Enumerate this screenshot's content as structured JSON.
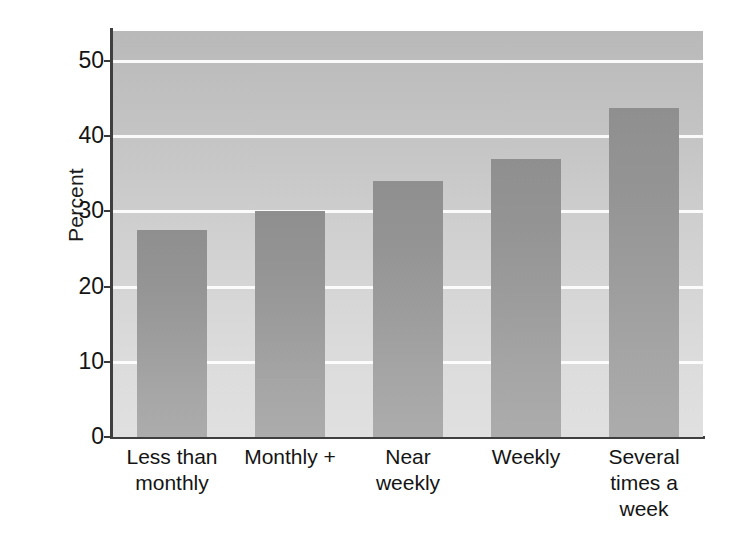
{
  "chart_data": {
    "type": "bar",
    "title": "",
    "subtitle": "",
    "xlabel": "",
    "ylabel": "Percent",
    "categories": [
      "Less than\nmonthly",
      "Monthly +",
      "Near\nweekly",
      "Weekly",
      "Several\ntimes a\nweek"
    ],
    "values": [
      27.5,
      30.0,
      34.0,
      37.0,
      43.7
    ],
    "ylim": [
      0,
      54
    ],
    "yticks": [
      0,
      10,
      20,
      30,
      40,
      50
    ],
    "ytick_labels": [
      "0",
      "10",
      "20",
      "30",
      "40",
      "50"
    ],
    "grid": true,
    "grid_axis": "y",
    "legend": false,
    "legend_position": "none",
    "bar_color": "#9a9a9a",
    "plot_background": "#cccccc",
    "gridline_color": "#ffffff",
    "axis_color": "#3f3f3f"
  },
  "axis": {
    "y_title": "Percent",
    "ticks": [
      {
        "label": "50",
        "value": 50
      },
      {
        "label": "40",
        "value": 40
      },
      {
        "label": "30",
        "value": 30
      },
      {
        "label": "20",
        "value": 20
      },
      {
        "label": "10",
        "value": 10
      },
      {
        "label": "0",
        "value": 0
      }
    ]
  },
  "bars": [
    {
      "label_lines": [
        "Less than",
        "monthly"
      ],
      "value": 27.5
    },
    {
      "label_lines": [
        "Monthly +"
      ],
      "value": 30.0
    },
    {
      "label_lines": [
        "Near",
        "weekly"
      ],
      "value": 34.0
    },
    {
      "label_lines": [
        "Weekly"
      ],
      "value": 37.0
    },
    {
      "label_lines": [
        "Several",
        "times a",
        "week"
      ],
      "value": 43.7
    }
  ]
}
